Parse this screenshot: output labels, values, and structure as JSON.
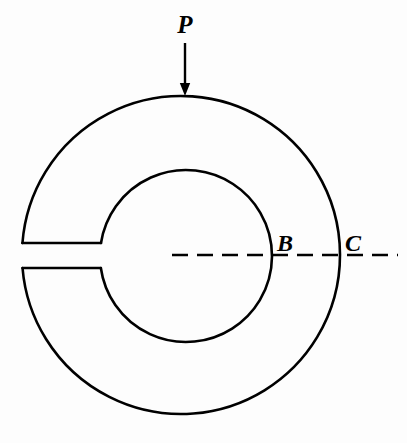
{
  "figure": {
    "kind": "engineering-mechanics-diagram",
    "background_color": "#fdfdfd",
    "stroke_color": "#000000",
    "stroke_width": 2.6
  },
  "labels": {
    "load": "P",
    "point_inner": "B",
    "point_outer": "C"
  },
  "geometry": {
    "outer_circle": {
      "cx": 181,
      "cy": 255,
      "r": 159
    },
    "inner_circle": {
      "cx": 186,
      "cy": 256,
      "r": 86
    },
    "slot": {
      "top_y": 243,
      "bottom_y": 268,
      "left_x": 27,
      "right_x": 103
    },
    "load_arrow": {
      "x": 185,
      "y_start": 43,
      "y_tip": 96
    },
    "centerline": {
      "y": 255,
      "x_start": 172,
      "x_end": 398,
      "dash": "16 9"
    }
  },
  "label_positions": {
    "load": {
      "x": 185,
      "y": 33
    },
    "point_inner": {
      "x": 277,
      "y": 251
    },
    "point_outer": {
      "x": 345,
      "y": 251
    }
  }
}
